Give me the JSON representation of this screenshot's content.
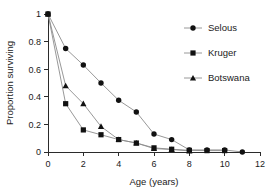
{
  "chart_data": {
    "type": "line",
    "title": "",
    "subtitle": "",
    "xlabel": "Age (years)",
    "ylabel": "Proportion surviving",
    "xlim": [
      0,
      12
    ],
    "ylim": [
      0,
      1
    ],
    "xticks": [
      0,
      2,
      4,
      6,
      8,
      10,
      12
    ],
    "xtick_labels": [
      "0",
      "2",
      "4",
      "6",
      "8",
      "10",
      "12"
    ],
    "yticks": [
      0,
      0.2,
      0.4,
      0.6,
      0.8,
      1
    ],
    "ytick_labels": [
      "0",
      "0.2",
      "0.4",
      "0.6",
      "0.8",
      "1"
    ],
    "grid": false,
    "legend_position": "top-right",
    "line_color": "#8c8c8c",
    "marker_color": "#111111",
    "series": [
      {
        "name": "Selous",
        "marker": "circle",
        "x": [
          0,
          1,
          2,
          3,
          4,
          5,
          6,
          7,
          8,
          9,
          10,
          11
        ],
        "values": [
          1.0,
          0.75,
          0.63,
          0.5,
          0.375,
          0.29,
          0.13,
          0.09,
          0.015,
          0.015,
          0.015,
          0.0
        ]
      },
      {
        "name": "Kruger",
        "marker": "square",
        "x": [
          0,
          1,
          2,
          3,
          4,
          5,
          6,
          7,
          8,
          9,
          10
        ],
        "values": [
          1.0,
          0.35,
          0.16,
          0.125,
          0.09,
          0.065,
          0.03,
          0.02,
          0.012,
          0.01,
          0.01
        ]
      },
      {
        "name": "Botswana",
        "marker": "triangle",
        "x": [
          0,
          1,
          2,
          3,
          4,
          5,
          6,
          7,
          8
        ],
        "values": [
          1.0,
          0.48,
          0.35,
          0.185,
          0.09,
          0.065,
          0.025,
          0.018,
          0.008
        ]
      }
    ]
  },
  "legend": {
    "entries": [
      {
        "label": "Selous",
        "marker": "circle"
      },
      {
        "label": "Kruger",
        "marker": "square"
      },
      {
        "label": "Botswana",
        "marker": "triangle"
      }
    ]
  }
}
